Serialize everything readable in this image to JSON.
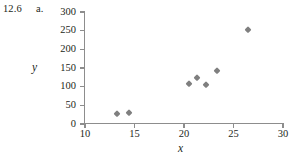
{
  "exercise": {
    "number": "12.6",
    "part": "a."
  },
  "chart_data": {
    "type": "scatter",
    "title": "",
    "xlabel": "x",
    "ylabel": "y",
    "xlim": [
      10,
      30
    ],
    "ylim": [
      0,
      300
    ],
    "xticks": [
      10,
      15,
      20,
      25,
      30
    ],
    "xtick_labels": [
      "10",
      "15",
      "20",
      "25",
      "30"
    ],
    "yticks": [
      0,
      50,
      100,
      150,
      200,
      250,
      300
    ],
    "ytick_labels": [
      "0",
      "50",
      "100",
      "150",
      "200",
      "250",
      "300"
    ],
    "grid": false,
    "legend": null,
    "marker": "diamond",
    "marker_color": "#7f7f7f",
    "points": [
      {
        "x": 13.2,
        "y": 27
      },
      {
        "x": 14.4,
        "y": 30
      },
      {
        "x": 20.5,
        "y": 108
      },
      {
        "x": 21.3,
        "y": 123
      },
      {
        "x": 22.2,
        "y": 105
      },
      {
        "x": 23.3,
        "y": 142
      },
      {
        "x": 26.5,
        "y": 252
      }
    ]
  }
}
